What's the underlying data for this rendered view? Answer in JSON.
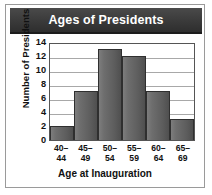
{
  "chart_data": {
    "type": "bar",
    "title": "Ages of Presidents",
    "xlabel": "Age at Inauguration",
    "ylabel": "Number of Presidents",
    "categories": [
      "40–44",
      "45–49",
      "50–54",
      "55–59",
      "60–64",
      "65–69"
    ],
    "category_lines": [
      [
        "40–",
        "44"
      ],
      [
        "45–",
        "49"
      ],
      [
        "50–",
        "54"
      ],
      [
        "55–",
        "59"
      ],
      [
        "60–",
        "64"
      ],
      [
        "65–",
        "69"
      ]
    ],
    "values": [
      2,
      7,
      13,
      12,
      7,
      3
    ],
    "ylim": [
      0,
      14
    ],
    "yticks": [
      0,
      2,
      4,
      6,
      8,
      10,
      12,
      14
    ],
    "ytick_labels": [
      "0",
      "2",
      "4",
      "6",
      "8",
      "10",
      "12",
      "14"
    ],
    "grid": true,
    "legend": "none",
    "bar_color": "#5d5d5d",
    "bar_border_color": "#2f2f2f",
    "title_bar_color": "#3a3a3a",
    "title_text_color": "#ffffff",
    "gridline_color": "#a8a8a8",
    "axis_color": "#555555",
    "text_color": "#111111"
  }
}
